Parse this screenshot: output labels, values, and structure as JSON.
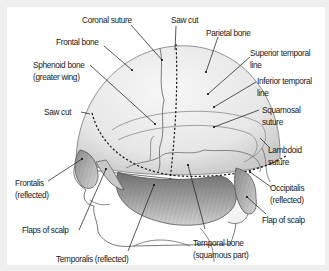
{
  "figure": {
    "colors": {
      "background": "#efefef",
      "panel": "#ffffff",
      "skull": "#ececec",
      "muscle": "#9a9a9a",
      "line": "#222222"
    }
  },
  "labels": {
    "coronal_suture": "Coronal suture",
    "saw_cut_top": "Saw cut",
    "parietal_bone": "Parietal bone",
    "frontal_bone": "Frontal bone",
    "sphenoid_l1": "Sphenoid bone",
    "sphenoid_l2": "(greater wing)",
    "superior_temporal_l1": "Superior temporal",
    "superior_temporal_l2": "line",
    "inferior_temporal_l1": "Inferior temporal",
    "inferior_temporal_l2": "line",
    "saw_cut_left": "Saw cut",
    "squamosal_l1": "Squamosal",
    "squamosal_l2": "suture",
    "lambdoid_l1": "Lambdoid",
    "lambdoid_l2": "suture",
    "frontalis_l1": "Frontalis",
    "frontalis_l2": "(reflected)",
    "occipitalis_l1": "Occipitalis",
    "occipitalis_l2": "(reflected)",
    "flaps_of_scalp": "Flaps of scalp",
    "flap_of_scalp": "Flap of scalp",
    "temporalis": "Temporalis (reflected)",
    "temporal_bone_l1": "Temporal bone",
    "temporal_bone_l2": "(squamous part)"
  }
}
